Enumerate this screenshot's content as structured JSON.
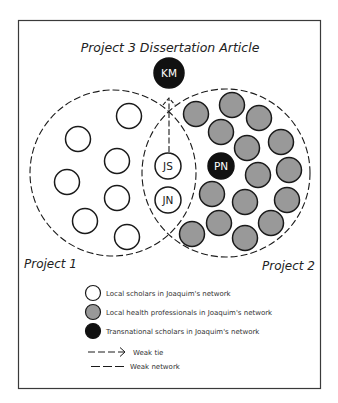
{
  "title": "Project 3 Dissertation Article",
  "colors": {
    "frame": "#3a3a3a",
    "local_scholar_fill": "#ffffff",
    "health_professional_fill": "#999999",
    "transnational_fill": "#111111",
    "stroke": "#1a1a1a"
  },
  "projects": {
    "project1": {
      "label": "Project 1",
      "cx": 113,
      "cy": 173,
      "r": 83
    },
    "project2": {
      "label": "Project 2",
      "cx": 226,
      "cy": 173,
      "r": 84
    }
  },
  "nodes": {
    "km": {
      "label": "KM",
      "type": "transnational",
      "cx": 169,
      "cy": 73,
      "r": 15
    },
    "js": {
      "label": "JS",
      "type": "local_scholar",
      "cx": 168,
      "cy": 166,
      "r": 13
    },
    "jn": {
      "label": "JN",
      "type": "local_scholar",
      "cx": 168,
      "cy": 200,
      "r": 13
    },
    "pn": {
      "label": "PN",
      "type": "transnational",
      "cx": 221,
      "cy": 166,
      "r": 13
    }
  },
  "local_scholars": [
    {
      "cx": 129,
      "cy": 116
    },
    {
      "cx": 78,
      "cy": 139
    },
    {
      "cx": 117,
      "cy": 161
    },
    {
      "cx": 67,
      "cy": 182
    },
    {
      "cx": 117,
      "cy": 198
    },
    {
      "cx": 85,
      "cy": 221
    },
    {
      "cx": 127,
      "cy": 237
    }
  ],
  "health_professionals": [
    {
      "cx": 196,
      "cy": 114
    },
    {
      "cx": 232,
      "cy": 105
    },
    {
      "cx": 259,
      "cy": 118
    },
    {
      "cx": 221,
      "cy": 132
    },
    {
      "cx": 247,
      "cy": 148
    },
    {
      "cx": 281,
      "cy": 142
    },
    {
      "cx": 258,
      "cy": 175
    },
    {
      "cx": 289,
      "cy": 170
    },
    {
      "cx": 212,
      "cy": 194
    },
    {
      "cx": 245,
      "cy": 202
    },
    {
      "cx": 287,
      "cy": 200
    },
    {
      "cx": 219,
      "cy": 223
    },
    {
      "cx": 271,
      "cy": 223
    },
    {
      "cx": 192,
      "cy": 234
    },
    {
      "cx": 245,
      "cy": 238
    }
  ],
  "edges": [
    {
      "from": "JS",
      "to": "KM",
      "type": "weak_tie"
    }
  ],
  "legend": {
    "local_scholars": "Local scholars in Joaquim's network",
    "health_professionals": "Local health professionals in Joaquim's network",
    "transnational_scholars": "Transnational scholars in Joaquim's network",
    "weak_tie": "Weak tie",
    "weak_network": "Weak network"
  }
}
